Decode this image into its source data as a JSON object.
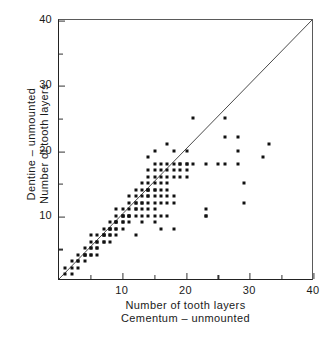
{
  "chart_data": {
    "type": "scatter",
    "title": "",
    "xlabel": "Number of tooth layers Cementum – unmounted",
    "ylabel": "Dentine – unmounted Number of tooth layers",
    "xlabel_lines": [
      "Number of tooth layers",
      "Cementum – unmounted"
    ],
    "ylabel_lines": [
      "Dentine – unmounted",
      "Number of tooth layers"
    ],
    "xlim": [
      0,
      40
    ],
    "ylim": [
      0,
      40
    ],
    "xticks": [
      10,
      20,
      30,
      40
    ],
    "yticks": [
      10,
      20,
      30,
      40
    ],
    "xticks_minor": [
      5,
      15,
      25,
      35
    ],
    "yticks_minor": [
      5,
      15,
      25,
      35
    ],
    "xtick_labels": [
      "10",
      "20",
      "30",
      "40"
    ],
    "ytick_labels": [
      "10",
      "20",
      "30",
      "40"
    ],
    "grid": false,
    "legend": null,
    "marker_color": "#111111",
    "line_color": "#4a4a4a",
    "reference_line": {
      "name": "identity-line",
      "equation": "y = x",
      "from": [
        0,
        0
      ],
      "to": [
        40,
        40
      ]
    },
    "points": [
      [
        1,
        1
      ],
      [
        1,
        2
      ],
      [
        2,
        1
      ],
      [
        2,
        2
      ],
      [
        2,
        3
      ],
      [
        3,
        2
      ],
      [
        3,
        3
      ],
      [
        3,
        3
      ],
      [
        3,
        4
      ],
      [
        4,
        3
      ],
      [
        4,
        4
      ],
      [
        4,
        4
      ],
      [
        4,
        5
      ],
      [
        4,
        4
      ],
      [
        5,
        4
      ],
      [
        5,
        5
      ],
      [
        5,
        5
      ],
      [
        5,
        6
      ],
      [
        5,
        4
      ],
      [
        5,
        7
      ],
      [
        6,
        5
      ],
      [
        6,
        6
      ],
      [
        6,
        6
      ],
      [
        6,
        7
      ],
      [
        6,
        5
      ],
      [
        6,
        4
      ],
      [
        7,
        6
      ],
      [
        7,
        7
      ],
      [
        7,
        7
      ],
      [
        7,
        8
      ],
      [
        7,
        6
      ],
      [
        7,
        7
      ],
      [
        8,
        7
      ],
      [
        8,
        8
      ],
      [
        8,
        8
      ],
      [
        8,
        9
      ],
      [
        8,
        7
      ],
      [
        8,
        8
      ],
      [
        8,
        6
      ],
      [
        9,
        8
      ],
      [
        9,
        9
      ],
      [
        9,
        9
      ],
      [
        9,
        10
      ],
      [
        9,
        8
      ],
      [
        9,
        9
      ],
      [
        9,
        11
      ],
      [
        9,
        7
      ],
      [
        10,
        9
      ],
      [
        10,
        10
      ],
      [
        10,
        10
      ],
      [
        10,
        9
      ],
      [
        10,
        10
      ],
      [
        10,
        8
      ],
      [
        10,
        11
      ],
      [
        11,
        10
      ],
      [
        11,
        10
      ],
      [
        11,
        11
      ],
      [
        11,
        12
      ],
      [
        11,
        10
      ],
      [
        11,
        9
      ],
      [
        11,
        13
      ],
      [
        12,
        11
      ],
      [
        12,
        12
      ],
      [
        12,
        12
      ],
      [
        12,
        13
      ],
      [
        12,
        11
      ],
      [
        12,
        14
      ],
      [
        12,
        10
      ],
      [
        12,
        7
      ],
      [
        13,
        12
      ],
      [
        13,
        12
      ],
      [
        13,
        13
      ],
      [
        13,
        14
      ],
      [
        13,
        11
      ],
      [
        13,
        15
      ],
      [
        13,
        10
      ],
      [
        13,
        9
      ],
      [
        14,
        13
      ],
      [
        14,
        14
      ],
      [
        14,
        14
      ],
      [
        14,
        14
      ],
      [
        14,
        13
      ],
      [
        14,
        15
      ],
      [
        14,
        12
      ],
      [
        14,
        16
      ],
      [
        14,
        17
      ],
      [
        14,
        11
      ],
      [
        14,
        19
      ],
      [
        14,
        10
      ],
      [
        15,
        14
      ],
      [
        15,
        14
      ],
      [
        15,
        15
      ],
      [
        15,
        13
      ],
      [
        15,
        16
      ],
      [
        15,
        12
      ],
      [
        15,
        17
      ],
      [
        15,
        18
      ],
      [
        15,
        11
      ],
      [
        15,
        20
      ],
      [
        15,
        10
      ],
      [
        15,
        9
      ],
      [
        16,
        15
      ],
      [
        16,
        16
      ],
      [
        16,
        14
      ],
      [
        16,
        17
      ],
      [
        16,
        13
      ],
      [
        16,
        18
      ],
      [
        16,
        12
      ],
      [
        16,
        10
      ],
      [
        16,
        8
      ],
      [
        17,
        16
      ],
      [
        17,
        17
      ],
      [
        17,
        15
      ],
      [
        17,
        18
      ],
      [
        17,
        13
      ],
      [
        17,
        12
      ],
      [
        17,
        14
      ],
      [
        17,
        10
      ],
      [
        17,
        21
      ],
      [
        18,
        17
      ],
      [
        18,
        18
      ],
      [
        18,
        16
      ],
      [
        18,
        13
      ],
      [
        18,
        12
      ],
      [
        18,
        20
      ],
      [
        18,
        8
      ],
      [
        19,
        18
      ],
      [
        19,
        17
      ],
      [
        19,
        16
      ],
      [
        19,
        18
      ],
      [
        20,
        18
      ],
      [
        20,
        20
      ],
      [
        20,
        16
      ],
      [
        20,
        17
      ],
      [
        20,
        18
      ],
      [
        21,
        25
      ],
      [
        21,
        18
      ],
      [
        23,
        18
      ],
      [
        23,
        11
      ],
      [
        23,
        10
      ],
      [
        23,
        10
      ],
      [
        25,
        18
      ],
      [
        26,
        25
      ],
      [
        26,
        22
      ],
      [
        26,
        18
      ],
      [
        28,
        22
      ],
      [
        28,
        20
      ],
      [
        28,
        18
      ],
      [
        29,
        15
      ],
      [
        29,
        12
      ],
      [
        32,
        19
      ],
      [
        33,
        21
      ]
    ]
  }
}
